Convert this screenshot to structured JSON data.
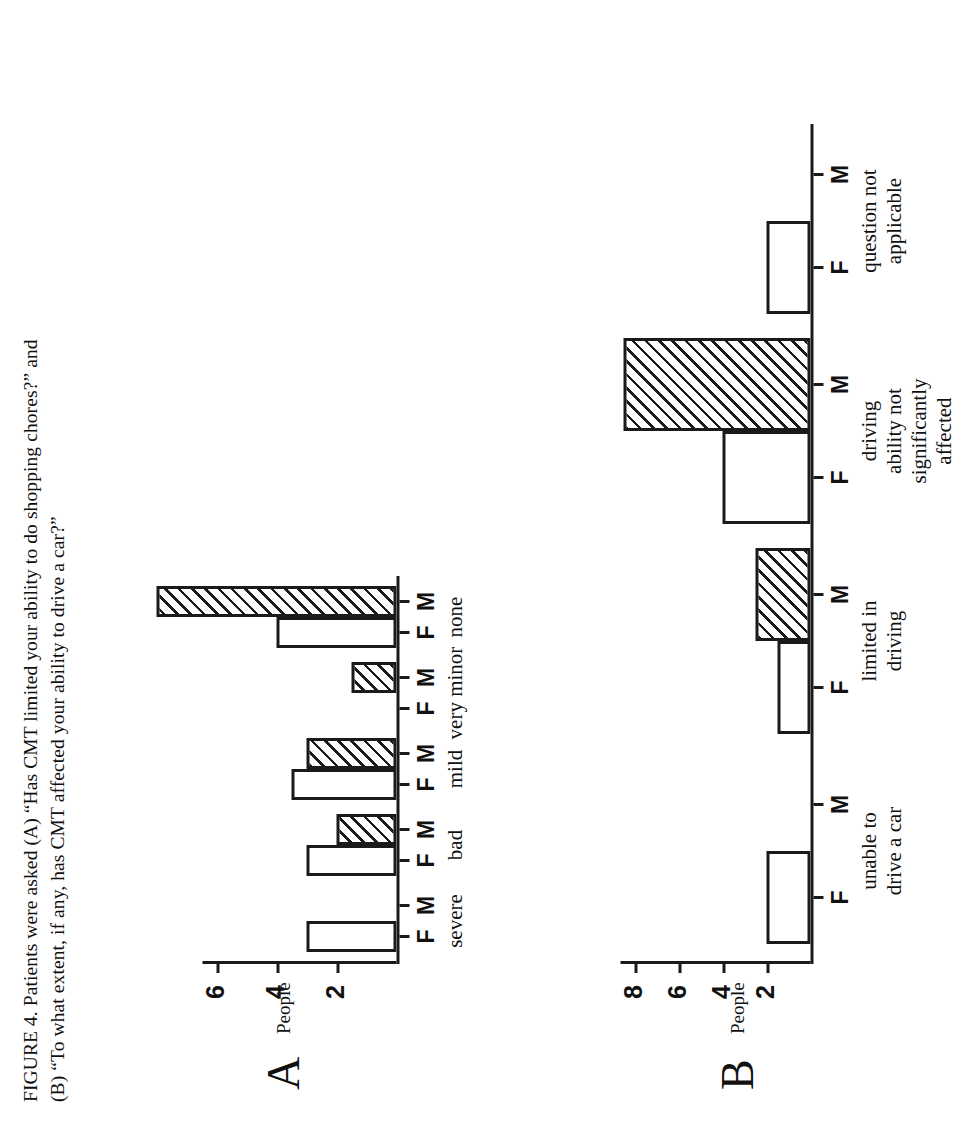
{
  "figure": {
    "caption_line1": "FIGURE 4. Patients were asked (A) “Has CMT limited your ability to do shopping chores?” and",
    "caption_line2": "(B) “To what extent, if any, has CMT affected your ability to drive a car?”"
  },
  "panelA": {
    "letter": "A",
    "ylabel": "People",
    "ytick_labels": [
      "2",
      "4",
      "6"
    ],
    "gender_labels": [
      "F",
      "M",
      "F",
      "M",
      "F",
      "M",
      "F",
      "M",
      "F",
      "M"
    ],
    "category_labels": [
      "severe",
      "bad",
      "mild",
      "very minor",
      "none"
    ]
  },
  "panelB": {
    "letter": "B",
    "ylabel": "People",
    "ytick_labels": [
      "2",
      "4",
      "6",
      "8"
    ],
    "gender_labels": [
      "F",
      "M",
      "F",
      "M",
      "F",
      "M",
      "F",
      "M"
    ],
    "category_labels": [
      "unable to\ndrive a car",
      "limited in\ndriving",
      "driving\nability not\nsignificantly\naffected",
      "question not\napplicable"
    ]
  },
  "chart_data": [
    {
      "id": "A",
      "type": "bar",
      "title": "(A) Has CMT limited your ability to do shopping chores?",
      "xlabel": "",
      "ylabel": "People",
      "ylim": [
        0,
        7
      ],
      "yticks": [
        2,
        4,
        6
      ],
      "grid": false,
      "categories": [
        "severe",
        "bad",
        "mild",
        "very minor",
        "none"
      ],
      "series": [
        {
          "name": "F",
          "fill": "open",
          "values": [
            3,
            3,
            3.5,
            0,
            4
          ]
        },
        {
          "name": "M",
          "fill": "hatched",
          "values": [
            0,
            2,
            3,
            1.5,
            8
          ]
        }
      ]
    },
    {
      "id": "B",
      "type": "bar",
      "title": "(B) To what extent, if any, has CMT affected your ability to drive a car?",
      "xlabel": "",
      "ylabel": "People",
      "ylim": [
        0,
        9.5
      ],
      "yticks": [
        2,
        4,
        6,
        8
      ],
      "grid": false,
      "categories": [
        "unable to drive a car",
        "limited in driving",
        "driving ability not significantly affected",
        "question not applicable"
      ],
      "series": [
        {
          "name": "F",
          "fill": "open",
          "values": [
            2,
            1.5,
            4,
            2
          ]
        },
        {
          "name": "M",
          "fill": "hatched",
          "values": [
            0,
            2.5,
            8.5,
            0
          ]
        }
      ]
    }
  ]
}
